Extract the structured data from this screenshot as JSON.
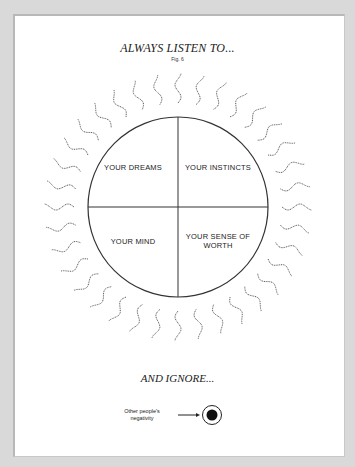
{
  "heading_top": "ALWAYS LISTEN TO...",
  "figure_label": "Fig. 6",
  "quadrants": {
    "top_left": "YOUR DREAMS",
    "top_right": "YOUR INSTINCTS",
    "bottom_left": "YOUR MIND",
    "bottom_right": "YOUR SENSE OF WORTH"
  },
  "heading_bottom": "AND IGNORE...",
  "ignore_label": "Other people's negativity",
  "colors": {
    "background": "#d9d9d9",
    "paper": "#ffffff",
    "ink": "#222222"
  }
}
